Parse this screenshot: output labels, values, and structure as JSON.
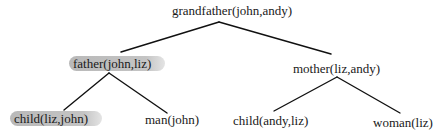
{
  "diagram": {
    "type": "proof-tree",
    "nodes": {
      "root": {
        "label": "grandfather(john,andy)"
      },
      "father": {
        "label": "father(john,liz)",
        "highlighted": true
      },
      "mother": {
        "label": "mother(liz,andy)"
      },
      "child_liz_john": {
        "label": "child(liz,john)",
        "highlighted": true
      },
      "man_john": {
        "label": "man(john)"
      },
      "child_andy_liz": {
        "label": "child(andy,liz)"
      },
      "woman_liz": {
        "label": "woman(liz)"
      }
    },
    "edges": [
      [
        "root",
        "father"
      ],
      [
        "root",
        "mother"
      ],
      [
        "father",
        "child_liz_john"
      ],
      [
        "father",
        "man_john"
      ],
      [
        "mother",
        "child_andy_liz"
      ],
      [
        "mother",
        "woman_liz"
      ]
    ],
    "highlight_color": "#bdbdbd",
    "line_color": "#111111"
  }
}
